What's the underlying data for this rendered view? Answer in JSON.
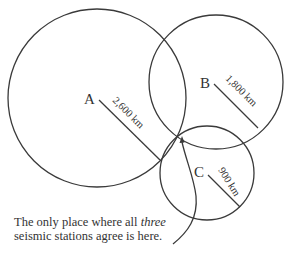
{
  "diagram": {
    "stations": [
      {
        "label": "A",
        "distance": "2,600 km",
        "center": [
          97,
          98
        ],
        "radius": 89
      },
      {
        "label": "B",
        "distance": "1,800 km",
        "center": [
          216,
          82
        ],
        "radius": 67
      },
      {
        "label": "C",
        "distance": "900 km",
        "center": [
          207,
          173
        ],
        "radius": 47
      }
    ],
    "caption": {
      "line1_pre": "The only place where all ",
      "line1_em": "three",
      "line2": "seismic stations agree is here."
    },
    "colors": {
      "stroke": "#3a3a3a",
      "text": "#333333",
      "background": "#ffffff"
    }
  }
}
